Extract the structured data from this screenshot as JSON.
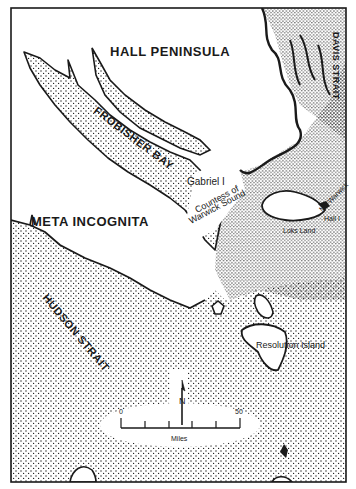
{
  "map": {
    "type": "historical-outline-map",
    "region": "Southern Baffin Island / Frobisher Bay area",
    "colors": {
      "ink": "#1a1a1a",
      "land": "#ffffff",
      "water_stipple": "#1a1a1a",
      "background": "#ffffff"
    },
    "frame": {
      "x": 11,
      "y": 8,
      "width": 335,
      "height": 474
    },
    "labels": {
      "hall_peninsula": "HALL PENINSULA",
      "davis_strait": "DAVIS STRAIT",
      "frobisher_bay": "FROBISHER BAY",
      "meta_incognita": "META INCOGNITA",
      "hudson_strait": "HUDSON STRAIT",
      "gabriel_island": "Gabriel I",
      "countess_line1": "Countess of",
      "countess_line2": "Warwick Sound",
      "mt_warwick": "Mt. Warwick",
      "hall_island": "Hall I",
      "loks_land": "Loks Land",
      "resolution_island": "Resolution Island"
    },
    "north_arrow": {
      "label": "N"
    },
    "scale_bar": {
      "start_label": "0",
      "end_label": "50",
      "unit_label": "Miles",
      "ticks": 6
    }
  }
}
